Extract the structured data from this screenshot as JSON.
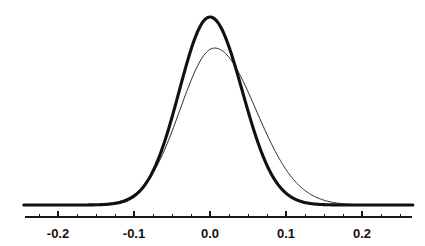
{
  "chart_data": {
    "type": "line",
    "title": "",
    "subtitle": "",
    "xlabel": "",
    "ylabel": "",
    "grid": false,
    "legend_position": "none",
    "xlim": [
      -0.245,
      0.267
    ],
    "ylim": [
      0,
      1.06
    ],
    "x_major_ticks": [
      -0.2,
      -0.1,
      0.0,
      0.1,
      0.2
    ],
    "x_major_tick_labels": [
      "-0.2",
      "-0.1",
      "0.0",
      "0.1",
      "0.2"
    ],
    "x_minor_tick_step": 0.025,
    "y_axis_visible": false,
    "annotations": [],
    "series": [
      {
        "name": "thick-curve",
        "style": "solid",
        "line_width": 3.1,
        "color": "#111111",
        "peak_x": 0.0,
        "peak_y": 1.0,
        "sigma_left": 0.0405,
        "sigma_right": 0.0425,
        "x": [
          -0.245,
          -0.23,
          -0.215,
          -0.2,
          -0.185,
          -0.17,
          -0.155,
          -0.14,
          -0.125,
          -0.11,
          -0.095,
          -0.08,
          -0.065,
          -0.05,
          -0.035,
          -0.02,
          -0.01,
          0.0,
          0.01,
          0.02,
          0.035,
          0.05,
          0.065,
          0.08,
          0.095,
          0.11,
          0.125,
          0.14,
          0.155,
          0.17,
          0.185,
          0.2,
          0.215,
          0.23,
          0.245,
          0.262
        ],
        "y": [
          0.001,
          0.002,
          0.003,
          0.004,
          0.007,
          0.012,
          0.021,
          0.035,
          0.058,
          0.092,
          0.14,
          0.207,
          0.294,
          0.4,
          0.521,
          0.644,
          0.74,
          0.981,
          0.973,
          0.891,
          0.744,
          0.572,
          0.405,
          0.265,
          0.159,
          0.088,
          0.045,
          0.021,
          0.009,
          0.004,
          0.002,
          0.001,
          0.001,
          0.0,
          0.0,
          0.0
        ]
      },
      {
        "name": "thin-curve",
        "style": "solid",
        "line_width": 1.0,
        "color": "#2b2b2b",
        "peak_x": 0.006,
        "peak_y": 0.835,
        "sigma_left": 0.0455,
        "sigma_right": 0.0545,
        "x": [
          -0.245,
          -0.23,
          -0.215,
          -0.2,
          -0.185,
          -0.17,
          -0.155,
          -0.14,
          -0.125,
          -0.11,
          -0.095,
          -0.08,
          -0.065,
          -0.05,
          -0.035,
          -0.02,
          -0.01,
          0.0,
          0.006,
          0.015,
          0.03,
          0.045,
          0.06,
          0.075,
          0.09,
          0.105,
          0.12,
          0.135,
          0.15,
          0.165,
          0.18,
          0.195,
          0.21,
          0.225,
          0.24,
          0.262
        ],
        "y": [
          0.002,
          0.003,
          0.005,
          0.008,
          0.013,
          0.021,
          0.033,
          0.05,
          0.074,
          0.106,
          0.149,
          0.203,
          0.27,
          0.348,
          0.44,
          0.552,
          0.64,
          0.756,
          0.835,
          0.823,
          0.768,
          0.672,
          0.556,
          0.435,
          0.322,
          0.227,
          0.152,
          0.097,
          0.059,
          0.034,
          0.019,
          0.01,
          0.005,
          0.002,
          0.001,
          0.0
        ]
      }
    ]
  },
  "geometry": {
    "baseline_y_px": 205,
    "axis_left_px": 25,
    "axis_right_px": 412,
    "x_zero_px": 210,
    "px_per_unit": 760,
    "peak_top_px": 17,
    "tick_major_len_px": 6,
    "tick_minor_len_px": 3,
    "label_y_px": 238
  }
}
